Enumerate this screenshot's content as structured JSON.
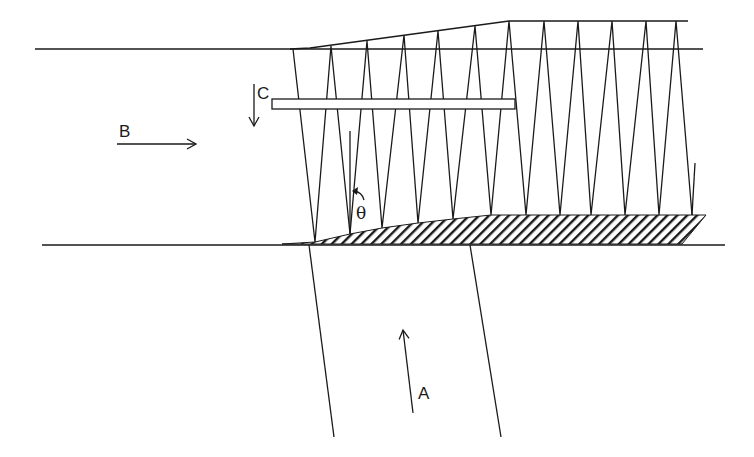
{
  "labels": {
    "a": "A",
    "b": "B",
    "c": "C",
    "theta": "θ"
  },
  "colors": {
    "stroke": "#1a1a1a",
    "background": "#ffffff"
  },
  "geometry": {
    "top_line": {
      "x1": 35,
      "y1": 49,
      "x2": 703,
      "y2": 49
    },
    "bottom_line": {
      "x1": 42,
      "y1": 245,
      "x2": 725,
      "y2": 245
    },
    "upper_boundary": [
      [
        290,
        49
      ],
      [
        310,
        48
      ],
      [
        509,
        21
      ],
      [
        688,
        21
      ]
    ],
    "zigzag_top": [
      [
        293,
        49
      ],
      [
        331,
        46
      ],
      [
        367,
        41
      ],
      [
        404,
        35
      ],
      [
        438,
        31
      ],
      [
        475,
        26
      ],
      [
        509,
        21
      ],
      [
        544,
        21
      ],
      [
        578,
        21
      ],
      [
        612,
        21
      ],
      [
        646,
        21
      ],
      [
        676,
        21
      ]
    ],
    "zigzag_bottom": [
      [
        315,
        242
      ],
      [
        350,
        234
      ],
      [
        382,
        228
      ],
      [
        418,
        223
      ],
      [
        453,
        219
      ],
      [
        491,
        215
      ],
      [
        526,
        215
      ],
      [
        560,
        215
      ],
      [
        591,
        215
      ],
      [
        625,
        215
      ],
      [
        659,
        215
      ],
      [
        692,
        215
      ]
    ],
    "end_stub": {
      "x1": 692,
      "y1": 215,
      "x2": 695,
      "y2": 163
    },
    "hatched_wedge": [
      [
        282,
        244
      ],
      [
        315,
        242
      ],
      [
        350,
        234
      ],
      [
        382,
        228
      ],
      [
        418,
        223
      ],
      [
        453,
        219
      ],
      [
        491,
        215
      ],
      [
        706,
        215
      ],
      [
        682,
        244
      ]
    ],
    "bar": {
      "x": 272,
      "y": 99,
      "width": 243,
      "height": 10
    },
    "channel_left": {
      "x1": 309,
      "y1": 245,
      "x2": 334,
      "y2": 437
    },
    "channel_right": {
      "x1": 470,
      "y1": 245,
      "x2": 501,
      "y2": 437
    },
    "arrow_a": {
      "x1": 413,
      "y1": 413,
      "x2": 403,
      "y2": 330
    },
    "arrow_b": {
      "x1": 117,
      "y1": 144,
      "x2": 196,
      "y2": 144
    },
    "arrow_c": {
      "x1": 254,
      "y1": 84,
      "x2": 254,
      "y2": 126
    },
    "theta_ref_line": {
      "x1": 350,
      "y1": 131,
      "x2": 350,
      "y2": 234
    }
  }
}
